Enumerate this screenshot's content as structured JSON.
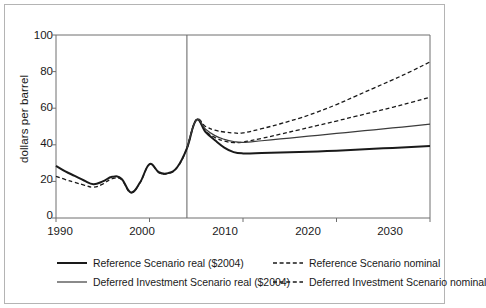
{
  "chart_data": {
    "type": "line",
    "title": "",
    "xlabel": "",
    "ylabel": "dollars per barrel",
    "xlim": [
      1990,
      2030
    ],
    "ylim": [
      0,
      100
    ],
    "grid": false,
    "legend_position": "bottom",
    "x_ticks": [
      "1990",
      "2000",
      "2010",
      "2020",
      "2030"
    ],
    "y_ticks": [
      "0",
      "20",
      "40",
      "60",
      "80",
      "100"
    ],
    "annotations": [
      {
        "name": "history-projection-divider",
        "type": "vertical-line",
        "x": 2004
      }
    ],
    "series": [
      {
        "name": "Reference Scenario real ($2004)",
        "style": "solid",
        "width": 2.0,
        "color": "#1a1a1a",
        "x": [
          1990,
          1991,
          1992,
          1993,
          1994,
          1995,
          1996,
          1997,
          1998,
          1999,
          2000,
          2001,
          2002,
          2003,
          2004,
          2005,
          2006,
          2007,
          2008,
          2009,
          2010,
          2012,
          2014,
          2016,
          2018,
          2020,
          2022,
          2024,
          2026,
          2028,
          2030
        ],
        "y": [
          28.5,
          25.5,
          23.0,
          20.5,
          18.5,
          20.0,
          22.5,
          21.5,
          14.0,
          19.5,
          29.5,
          25.0,
          24.5,
          28.0,
          38.0,
          53.5,
          47.0,
          42.5,
          38.5,
          36.0,
          35.3,
          35.5,
          35.8,
          36.1,
          36.4,
          36.8,
          37.3,
          37.8,
          38.3,
          38.8,
          39.3
        ]
      },
      {
        "name": "Deferred Investment Scenario real ($2004)",
        "style": "solid",
        "width": 1.2,
        "color": "#3c3c3c",
        "x": [
          2004,
          2005,
          2006,
          2007,
          2008,
          2009,
          2010,
          2012,
          2014,
          2016,
          2018,
          2020,
          2022,
          2024,
          2026,
          2028,
          2030
        ],
        "y": [
          38.0,
          53.5,
          48.5,
          45.0,
          43.0,
          41.8,
          41.3,
          42.2,
          43.2,
          44.2,
          45.2,
          46.2,
          47.2,
          48.2,
          49.2,
          50.2,
          51.3
        ]
      },
      {
        "name": "Reference Scenario nominal",
        "style": "dashed",
        "width": 1.3,
        "color": "#1a1a1a",
        "x": [
          1990,
          1991,
          1992,
          1993,
          1994,
          1995,
          1996,
          1997,
          1998,
          1999,
          2000,
          2001,
          2002,
          2003,
          2004,
          2005,
          2006,
          2007,
          2008,
          2009,
          2010,
          2012,
          2014,
          2016,
          2018,
          2020,
          2022,
          2024,
          2026,
          2028,
          2030
        ],
        "y": [
          22.8,
          21.0,
          19.5,
          18.0,
          16.8,
          18.5,
          21.5,
          21.0,
          13.8,
          19.3,
          29.3,
          24.8,
          24.3,
          27.8,
          38.0,
          53.5,
          47.5,
          44.0,
          42.0,
          41.2,
          41.5,
          43.5,
          45.8,
          48.2,
          50.6,
          53.0,
          55.5,
          58.0,
          60.5,
          63.2,
          66.0
        ]
      },
      {
        "name": "Deferred Investment Scenario nominal",
        "style": "dashed",
        "width": 1.3,
        "color": "#1a1a1a",
        "x": [
          2004,
          2005,
          2006,
          2007,
          2008,
          2009,
          2010,
          2012,
          2014,
          2016,
          2018,
          2020,
          2022,
          2024,
          2026,
          2028,
          2030
        ],
        "y": [
          38.0,
          53.5,
          50.0,
          48.0,
          47.0,
          46.5,
          46.5,
          48.8,
          51.5,
          54.5,
          58.0,
          62.0,
          66.5,
          71.0,
          75.5,
          80.2,
          85.3
        ]
      }
    ]
  },
  "axis": {
    "y_label": "dollars per barrel",
    "y_ticks": [
      "100",
      "80",
      "60",
      "40",
      "20",
      "0"
    ],
    "x_ticks": [
      "1990",
      "2000",
      "2010",
      "2020",
      "2030"
    ]
  },
  "legend": {
    "left": [
      {
        "label": "Reference Scenario real ($2004)",
        "style": "solid",
        "width": 2.0,
        "color": "#1a1a1a"
      },
      {
        "label": "Deferred Investment Scenario real ($2004)",
        "style": "solid",
        "width": 1.2,
        "color": "#3c3c3c"
      }
    ],
    "right": [
      {
        "label": "Reference Scenario nominal",
        "style": "dashed",
        "width": 1.3,
        "color": "#1a1a1a"
      },
      {
        "label": "Deferred Investment Scenario nominal",
        "style": "dashed",
        "width": 1.3,
        "color": "#1a1a1a"
      }
    ]
  },
  "colors": {
    "axis": "#6e6e6e",
    "text": "#1a1a1a",
    "frame": "#b4b4b4",
    "background": "#ffffff"
  }
}
